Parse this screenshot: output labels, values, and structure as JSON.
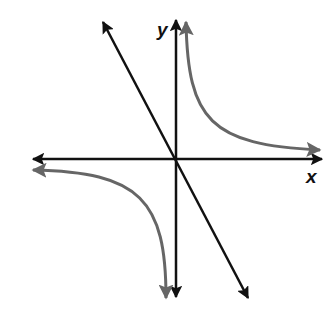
{
  "graph": {
    "x_label": "x",
    "y_label": "y",
    "colors": {
      "axes": "#111111",
      "line": "#111111",
      "curve": "#666666",
      "background": "#ffffff"
    },
    "elements": [
      {
        "name": "x-axis",
        "type": "axis",
        "direction": "horizontal",
        "arrows": "both"
      },
      {
        "name": "y-axis",
        "type": "axis",
        "direction": "vertical",
        "arrows": "both"
      },
      {
        "name": "decreasing-line",
        "type": "line",
        "description": "straight line through origin with negative slope, arrows at both ends"
      },
      {
        "name": "hyperbola-branch-q1",
        "type": "curve",
        "description": "branch in quadrant I approaching y-axis and x-axis asymptotically"
      },
      {
        "name": "hyperbola-branch-q3",
        "type": "curve",
        "description": "branch in quadrant III approaching x-axis and y-axis asymptotically"
      }
    ]
  }
}
